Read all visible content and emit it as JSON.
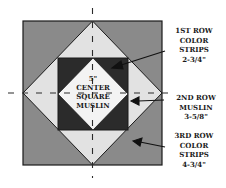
{
  "diagram": {
    "colors": {
      "outer_color_strips": "#8a8a8a",
      "muslin_row": "#e2e2e2",
      "first_row_color_strips": "#2b2b2b",
      "center_square": "#f3f3f3",
      "outline": "#1a1a1a"
    },
    "center_label": [
      "5\"",
      "CENTER",
      "SQUARE",
      "MUSLIN"
    ],
    "callouts": [
      {
        "id": "first-row",
        "lines": [
          "1ST ROW",
          "COLOR",
          "STRIPS",
          "2-3/4\""
        ]
      },
      {
        "id": "second-row",
        "lines": [
          "2ND ROW",
          "MUSLIN",
          "3-5/8\""
        ]
      },
      {
        "id": "third-row",
        "lines": [
          "3RD ROW",
          "COLOR",
          "STRIPS",
          "4-3/4\""
        ]
      }
    ]
  }
}
